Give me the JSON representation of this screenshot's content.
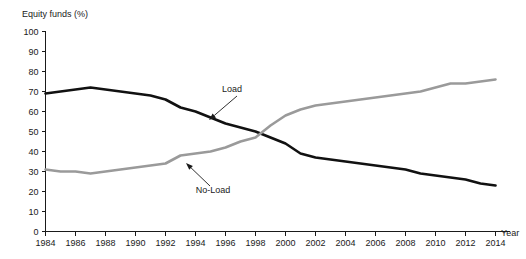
{
  "chart_data": {
    "type": "line",
    "title": "",
    "ylabel": "Equity funds (%)",
    "xlabel": "Year",
    "ylim": [
      0,
      100
    ],
    "xlim": [
      1984,
      2014
    ],
    "grid": false,
    "legend_position": "inline-annotations",
    "yticks": [
      "0",
      "10",
      "20",
      "30",
      "40",
      "50",
      "60",
      "70",
      "80",
      "90",
      "100"
    ],
    "xticks": [
      "1984",
      "1986",
      "1988",
      "1990",
      "1992",
      "1994",
      "1996",
      "1998",
      "2000",
      "2002",
      "2004",
      "2006",
      "2008",
      "2010",
      "2012",
      "2014"
    ],
    "x": [
      1984,
      1985,
      1986,
      1987,
      1988,
      1989,
      1990,
      1991,
      1992,
      1993,
      1994,
      1995,
      1996,
      1997,
      1998,
      1999,
      2000,
      2001,
      2002,
      2003,
      2004,
      2005,
      2006,
      2007,
      2008,
      2009,
      2010,
      2011,
      2012,
      2013,
      2014
    ],
    "series": [
      {
        "name": "Load",
        "color": "#111111",
        "width": 2.6,
        "values": [
          69,
          70,
          71,
          72,
          71,
          70,
          69,
          68,
          66,
          62,
          60,
          57,
          54,
          52,
          50,
          47,
          44,
          39,
          37,
          36,
          35,
          34,
          33,
          32,
          31,
          29,
          28,
          27,
          26,
          24,
          23
        ]
      },
      {
        "name": "No-Load",
        "color": "#9a9a9a",
        "width": 2.6,
        "values": [
          31,
          30,
          30,
          29,
          30,
          31,
          32,
          33,
          34,
          38,
          39,
          40,
          42,
          45,
          47,
          53,
          58,
          61,
          63,
          64,
          65,
          66,
          67,
          68,
          69,
          70,
          72,
          74,
          74,
          75,
          76
        ]
      }
    ],
    "annotations": [
      {
        "label": "Load",
        "text_x": 232,
        "text_y": 92,
        "arrow_from_x": 237,
        "arrow_from_y": 96,
        "arrow_to_x": 209,
        "arrow_to_y": 120
      },
      {
        "label": "No-Load",
        "text_x": 213,
        "text_y": 193,
        "arrow_from_x": 210,
        "arrow_from_y": 186,
        "arrow_to_x": 186,
        "arrow_to_y": 163
      }
    ]
  },
  "axis": {
    "y_label": "Equity funds (%)",
    "x_label": "Year"
  }
}
